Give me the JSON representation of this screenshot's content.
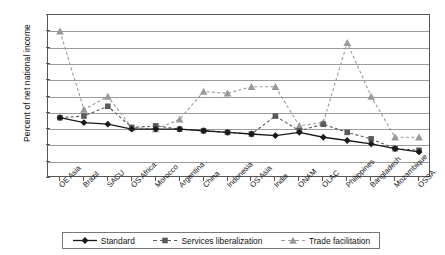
{
  "chart_data": {
    "type": "line",
    "title": "",
    "xlabel": "",
    "ylabel": "Percent of net national income",
    "ylim": [
      -2,
      8
    ],
    "yticks": [
      8,
      7,
      6,
      5,
      4,
      3,
      2,
      1,
      0,
      -1,
      -2
    ],
    "grid": true,
    "legend_position": "bottom",
    "categories": [
      "OE Asia",
      "Brazil",
      "SACU",
      "OS Africa",
      "Morocco",
      "Argentina",
      "China",
      "Indonesia",
      "OS Asia",
      "India",
      "ONAM",
      "OLAC",
      "Philippines",
      "Bangladesh",
      "Mozambique",
      "OSSA"
    ],
    "series": [
      {
        "name": "Standard",
        "color": "#1a1a1a",
        "marker": "diamond",
        "dash": "solid",
        "values": [
          1.7,
          1.4,
          1.3,
          1.0,
          1.0,
          1.0,
          0.9,
          0.8,
          0.7,
          0.6,
          0.8,
          0.5,
          0.3,
          0.1,
          -0.2,
          -0.4
        ]
      },
      {
        "name": "Services liberalization",
        "color": "#5a5a5a",
        "marker": "square",
        "dash": "dashed",
        "values": [
          1.7,
          1.8,
          2.4,
          1.1,
          1.2,
          1.0,
          0.9,
          0.8,
          0.7,
          1.8,
          0.9,
          1.3,
          0.8,
          0.4,
          -0.2,
          -0.3
        ]
      },
      {
        "name": "Trade facilitation",
        "color": "#999999",
        "marker": "triangle",
        "dash": "dashed",
        "values": [
          7.0,
          2.2,
          3.0,
          1.1,
          1.0,
          1.6,
          3.3,
          3.2,
          3.6,
          3.6,
          1.2,
          1.4,
          6.3,
          3.0,
          0.5,
          0.5
        ]
      }
    ],
    "legend": [
      {
        "label": "Standard",
        "marker": "diamond",
        "dash": "solid",
        "color": "#1a1a1a"
      },
      {
        "label": "Services liberalization",
        "marker": "square",
        "dash": "dashed",
        "color": "#5a5a5a"
      },
      {
        "label": "Trade facilitation",
        "marker": "triangle",
        "dash": "dashed",
        "color": "#999999"
      }
    ]
  }
}
